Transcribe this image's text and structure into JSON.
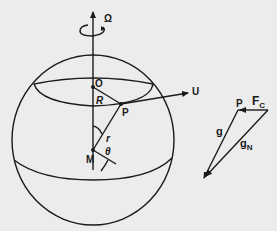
{
  "diagram": {
    "type": "rotating-earth-gravity-vectors",
    "colors": {
      "background": "#ececec",
      "ink": "#1a1a1a"
    },
    "labels": {
      "omega": "Ω",
      "origin": "O",
      "radius_R": "R",
      "point": "P",
      "velocity": "U",
      "center": "M",
      "radius_r": "r",
      "angle": "θ"
    },
    "vector_triangle": {
      "point": "P",
      "centrifugal": "F",
      "centrifugal_sub": "C",
      "gravity": "g",
      "gravity_bar": "→",
      "newtonian": "g",
      "newtonian_sub": "N"
    }
  }
}
